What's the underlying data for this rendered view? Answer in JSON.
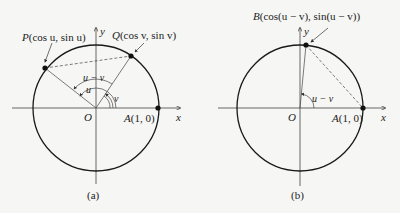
{
  "figure_a": {
    "caption": "(a)",
    "point_p": {
      "name": "P",
      "label": "(cos u, sin u)"
    },
    "point_q": {
      "name": "Q",
      "label": "(cos v, sin v)"
    },
    "point_a": {
      "name": "A",
      "label": "(1, 0)"
    },
    "origin": "O",
    "x_axis": "x",
    "y_axis": "y",
    "angle_u": "u",
    "angle_v": "v",
    "angle_u_minus_v": "u − v"
  },
  "figure_b": {
    "caption": "(b)",
    "point_b": {
      "name": "B",
      "label": "(cos(u − v), sin(u − v))"
    },
    "point_a": {
      "name": "A",
      "label": "(1, 0)"
    },
    "origin": "O",
    "x_axis": "x",
    "y_axis": "y",
    "angle_u_minus_v": "u − v"
  },
  "colors": {
    "stroke": "#1a1a1a",
    "background": "#f6f6f4"
  }
}
